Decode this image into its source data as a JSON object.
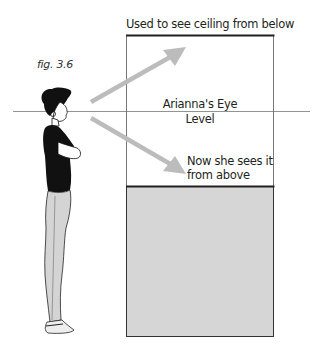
{
  "figure": {
    "caption": "fig. 3.6",
    "ceiling_label": "Used to see ceiling from below",
    "eye_level_line1": "Arianna's Eye",
    "eye_level_line2": "Level",
    "now_label_line1": "Now she sees it",
    "now_label_line2": "from above"
  },
  "colors": {
    "stroke": "#231f20",
    "thin_line": "#666666",
    "arrow": "#bcbcbc",
    "box_fill": "#d6d6d6",
    "figure_shirt": "#111111",
    "figure_pants": "#d4d4d4"
  },
  "geometry": {
    "horizon_y": 111,
    "upper_box": {
      "x": 126,
      "y": 35,
      "w": 148,
      "h": 151
    },
    "lower_box": {
      "x": 126,
      "y": 186,
      "w": 148,
      "h": 151
    }
  }
}
